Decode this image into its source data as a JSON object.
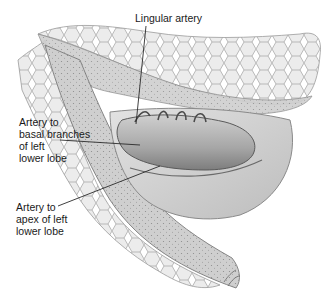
{
  "figure": {
    "palette": {
      "background": "#ffffff",
      "alveolar_fill": "#e6e6e6",
      "alveolar_stroke": "#a8a8a8",
      "pleura_fill": "#c9c9c9",
      "vessel_fill": "#b8b8b8",
      "vessel_dark": "#5a5a5a",
      "leader_line": "#2a2a2a",
      "text": "#1a1a1a"
    }
  },
  "labels": {
    "lingular_artery": "Lingular artery",
    "basal_branches": "Artery to\nbasal branches\nof left\nlower lobe",
    "apex_lower_lobe": "Artery to\napex of left\nlower lobe"
  }
}
